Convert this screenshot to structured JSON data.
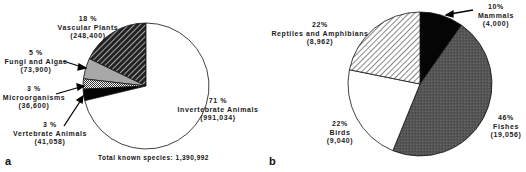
{
  "chart_data": [
    {
      "type": "pie",
      "panel": "a",
      "title": "",
      "footer": "Total known species: 1,390,992",
      "total": 1390992,
      "slices": [
        {
          "label": "Vascular Plants",
          "percent": "18 %",
          "count": "(248,400)",
          "value": 248400,
          "fill": "dark-diagonal-hatch"
        },
        {
          "label": "Fungi and Algae",
          "percent": "5 %",
          "count": "(73,900)",
          "value": 73900,
          "fill": "light-gray"
        },
        {
          "label": "Microorganisms",
          "percent": "3 %",
          "count": "(36,600)",
          "value": 36600,
          "fill": "checkered"
        },
        {
          "label": "Vertebrate Animals",
          "percent": "3 %",
          "count": "(41,058)",
          "value": 41058,
          "fill": "black"
        },
        {
          "label": "Invertebrate Animals",
          "percent": "71 %",
          "count": "(991,034)",
          "value": 991034,
          "fill": "white"
        }
      ]
    },
    {
      "type": "pie",
      "panel": "b",
      "title": "",
      "slices": [
        {
          "label": "Mammals",
          "percent": "10%",
          "count": "(4,000)",
          "value": 4000,
          "fill": "black"
        },
        {
          "label": "Fishes",
          "percent": "46%",
          "count": "(19,056)",
          "value": 19056,
          "fill": "dark-gray"
        },
        {
          "label": "Birds",
          "percent": "22%",
          "count": "(9,040)",
          "value": 9040,
          "fill": "white"
        },
        {
          "label": "Reptiles and Amphibians",
          "percent": "22%",
          "count": "(8,962)",
          "value": 8962,
          "fill": "light-diagonal-hatch"
        }
      ]
    }
  ],
  "panels": {
    "a": {
      "letter": "a",
      "total_label": "Total known species: 1,390,992"
    },
    "b": {
      "letter": "b"
    }
  }
}
